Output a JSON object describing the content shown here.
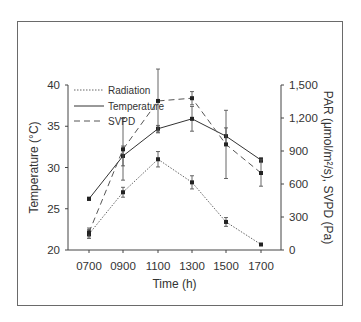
{
  "chart_data": {
    "type": "line",
    "title": "",
    "xlabel": "Time (h)",
    "ylabel_left": "Temperature (°C)",
    "ylabel_right": "PAR (μmol/m²/s), SVPD (Pa)",
    "categories": [
      "0700",
      "0900",
      "1100",
      "1300",
      "1500",
      "1700"
    ],
    "ylim_left": [
      20,
      40
    ],
    "yticks_left": [
      "20",
      "25",
      "30",
      "35",
      "40"
    ],
    "ylim_right": [
      0,
      1500
    ],
    "yticks_right": [
      "0",
      "300",
      "600",
      "900",
      "1,200",
      "1,500"
    ],
    "grid": false,
    "legend_position": "upper left",
    "series": [
      {
        "name": "Radiation",
        "axis": "right",
        "style": "dotted",
        "values": [
          145,
          525,
          825,
          615,
          255,
          50
        ],
        "errors": [
          40,
          45,
          70,
          60,
          40,
          0
        ]
      },
      {
        "name": "Temperature",
        "axis": "left",
        "style": "solid",
        "values": [
          26.2,
          31.4,
          34.7,
          35.9,
          33.8,
          30.9
        ],
        "errors": [
          0.2,
          1.2,
          0.4,
          1.5,
          1.0,
          0.3
        ]
      },
      {
        "name": "SVPD",
        "axis": "right",
        "style": "dashed",
        "values": [
          160,
          915,
          1355,
          1380,
          960,
          700
        ],
        "errors": [
          40,
          280,
          290,
          60,
          310,
          120
        ]
      }
    ]
  },
  "legend": {
    "items": [
      {
        "label": "Radiation"
      },
      {
        "label": "Temperature"
      },
      {
        "label": "SVPD"
      }
    ]
  }
}
